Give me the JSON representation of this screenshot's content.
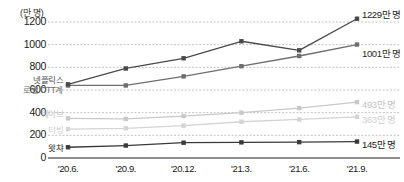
{
  "chart_data": {
    "type": "line",
    "title": "",
    "unit_label": "(만 명)",
    "xlabel": "",
    "ylabel": "",
    "ylim": [
      0,
      1200
    ],
    "yticks": [
      1200,
      1000,
      800,
      600,
      400,
      200,
      0
    ],
    "grid": true,
    "legend_position": "inline-left",
    "categories": [
      "'20.6.",
      "'20.9.",
      "'20.12.",
      "'21.3.",
      "'21.6.",
      "'21.9."
    ],
    "series": [
      {
        "name": "넷플릭스",
        "color": "#4a4a4a",
        "values": [
          650,
          790,
          880,
          1030,
          950,
          1229
        ],
        "end_label": "1229만 명"
      },
      {
        "name": "로컬 OTT계",
        "color": "#6e6e6e",
        "values": [
          640,
          640,
          720,
          810,
          900,
          1001
        ],
        "end_label": "1001만 명"
      },
      {
        "name": "웨이브",
        "color": "#c9c9c9",
        "values": [
          350,
          345,
          370,
          400,
          440,
          493
        ],
        "end_label": "493만 명"
      },
      {
        "name": "티빙",
        "color": "#d4d4d4",
        "values": [
          255,
          262,
          285,
          320,
          340,
          363
        ],
        "end_label": "363만 명"
      },
      {
        "name": "왓챠",
        "color": "#3a3a3a",
        "values": [
          95,
          110,
          135,
          138,
          140,
          145
        ],
        "end_label": "145만 명"
      }
    ]
  }
}
